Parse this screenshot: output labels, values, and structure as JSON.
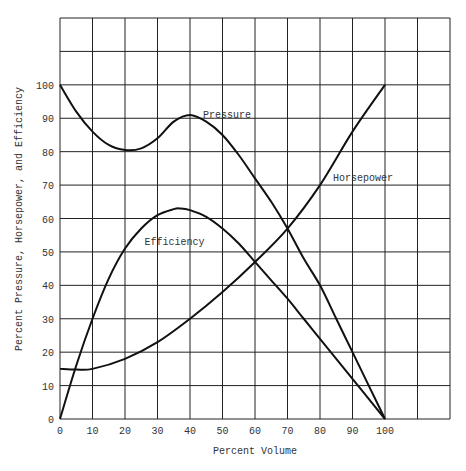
{
  "chart_data": {
    "type": "line",
    "title": "",
    "xlabel": "Percent Volume",
    "ylabel": "Percent Pressure, Horsepower, and Efficiency",
    "xlim": [
      0,
      120
    ],
    "ylim": [
      0,
      120
    ],
    "grid": true,
    "legend": "inline curve labels",
    "x_ticks": [
      0,
      10,
      20,
      30,
      40,
      50,
      60,
      70,
      80,
      90,
      100
    ],
    "y_ticks": [
      0,
      10,
      20,
      30,
      40,
      50,
      60,
      70,
      80,
      90,
      100
    ],
    "series": [
      {
        "name": "Pressure",
        "label_pos": [
          40,
          91
        ],
        "x": [
          0,
          5,
          10,
          15,
          20,
          25,
          30,
          35,
          40,
          45,
          50,
          55,
          60,
          65,
          70,
          75,
          80,
          85,
          90,
          95,
          100
        ],
        "y": [
          100,
          92,
          86,
          82,
          80.5,
          81,
          84,
          89,
          91,
          89,
          85,
          79,
          72,
          65,
          57,
          48,
          40,
          30,
          20,
          10,
          0
        ]
      },
      {
        "name": "Efficiency",
        "label_pos": [
          22,
          53
        ],
        "x": [
          0,
          5,
          10,
          15,
          20,
          25,
          30,
          35,
          37,
          40,
          45,
          50,
          55,
          60,
          65,
          70,
          75,
          80,
          85,
          90,
          95,
          100
        ],
        "y": [
          0,
          16,
          30,
          42,
          51,
          57,
          61,
          62.8,
          63,
          62.5,
          60.5,
          57,
          52.5,
          47,
          41.5,
          36,
          30,
          24,
          18,
          12,
          6,
          0
        ]
      },
      {
        "name": "Horsepower",
        "label_pos": [
          80,
          72
        ],
        "x": [
          0,
          5,
          10,
          20,
          30,
          40,
          50,
          60,
          70,
          80,
          90,
          100
        ],
        "y": [
          15,
          14.8,
          15,
          18,
          23,
          30,
          38,
          47,
          57,
          70,
          86,
          100
        ]
      }
    ]
  }
}
